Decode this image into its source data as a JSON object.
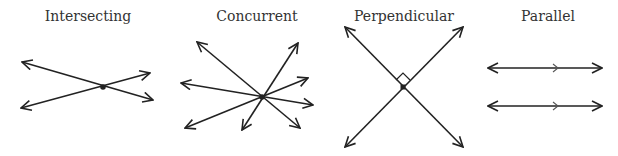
{
  "labels": {
    "intersecting": "Intersecting",
    "concurrent": "Concurrent",
    "perpendicular": "Perpendicular",
    "parallel": "Parallel"
  },
  "colors": {
    "stroke": "#222222",
    "text": "#333333"
  }
}
